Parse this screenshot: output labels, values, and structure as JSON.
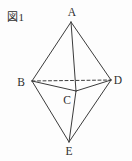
{
  "figure": {
    "caption": "図1",
    "background": "#fdfdfd",
    "line_color": "#3b3b3b",
    "label_color": "#2e2e2e",
    "line_width": 1,
    "dash_pattern": "3 2.5",
    "shape": "triangular-bipyramid",
    "vertices": {
      "A": {
        "label": "A",
        "x": 71,
        "y": 22,
        "label_x": 72,
        "label_y": 16
      },
      "B": {
        "label": "B",
        "x": 32,
        "y": 81,
        "label_x": 21,
        "label_y": 86
      },
      "C": {
        "label": "C",
        "x": 76,
        "y": 91,
        "label_x": 67,
        "label_y": 104
      },
      "D": {
        "label": "D",
        "x": 111,
        "y": 80,
        "label_x": 118,
        "label_y": 84
      },
      "E": {
        "label": "E",
        "x": 69,
        "y": 142,
        "label_x": 69,
        "label_y": 155
      }
    },
    "edges": [
      {
        "from": "A",
        "to": "B",
        "style": "solid"
      },
      {
        "from": "A",
        "to": "C",
        "style": "solid"
      },
      {
        "from": "A",
        "to": "D",
        "style": "solid"
      },
      {
        "from": "B",
        "to": "C",
        "style": "solid"
      },
      {
        "from": "C",
        "to": "D",
        "style": "solid"
      },
      {
        "from": "B",
        "to": "E",
        "style": "solid"
      },
      {
        "from": "C",
        "to": "E",
        "style": "solid"
      },
      {
        "from": "D",
        "to": "E",
        "style": "solid"
      },
      {
        "from": "B",
        "to": "D",
        "style": "dashed"
      }
    ]
  }
}
